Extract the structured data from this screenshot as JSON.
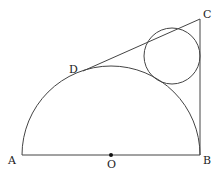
{
  "diagram": {
    "type": "geometry",
    "labels": {
      "A": "A",
      "B": "B",
      "C": "C",
      "D": "D",
      "O": "O"
    },
    "colors": {
      "stroke": "#444444",
      "text": "#222222",
      "background": "#ffffff"
    }
  }
}
